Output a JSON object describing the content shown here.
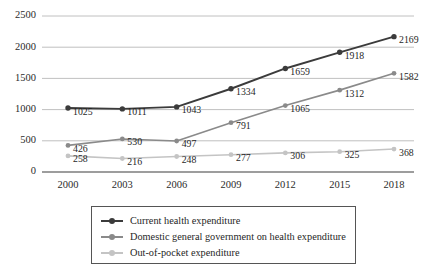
{
  "chart_data": {
    "type": "line",
    "title": "",
    "subtitle": "",
    "xlabel": "",
    "ylabel": "",
    "categories": [
      "2000",
      "2003",
      "2006",
      "2009",
      "2012",
      "2015",
      "2018"
    ],
    "x": [
      2000,
      2003,
      2006,
      2009,
      2012,
      2015,
      2018
    ],
    "ylim": [
      0,
      2500
    ],
    "yticks": [
      0,
      500,
      1000,
      1500,
      2000,
      2500
    ],
    "ytick_labels": [
      "0",
      "500",
      "1000",
      "1500",
      "2000",
      "2500"
    ],
    "grid": true,
    "grid_axis": "y",
    "legend_position": "bottom",
    "data_labels": true,
    "series": [
      {
        "name": "Current health expenditure",
        "color": "#3b3b3b",
        "values": [
          1025,
          1011,
          1043,
          1334,
          1659,
          1918,
          2169
        ],
        "labels": [
          "1025",
          "1011",
          "1043",
          "1334",
          "1659",
          "1918",
          "2169"
        ]
      },
      {
        "name": "Domestic general government on health expenditure",
        "color": "#8a8a8a",
        "values": [
          426,
          530,
          497,
          791,
          1065,
          1312,
          1582
        ],
        "labels": [
          "426",
          "530",
          "497",
          "791",
          "1065",
          "1312",
          "1582"
        ]
      },
      {
        "name": "Out-of-pocket expenditure",
        "color": "#c4c4c4",
        "values": [
          258,
          216,
          248,
          277,
          306,
          325,
          368
        ],
        "labels": [
          "258",
          "216",
          "248",
          "277",
          "306",
          "325",
          "368"
        ]
      }
    ]
  },
  "legend": {
    "items": [
      {
        "label": "Current health expenditure",
        "color": "#3b3b3b"
      },
      {
        "label": "Domestic general government on health expenditure",
        "color": "#8a8a8a"
      },
      {
        "label": "Out-of-pocket expenditure",
        "color": "#c4c4c4"
      }
    ]
  },
  "colors": {
    "gridline": "#b9b9b9",
    "axis": "#7d7d7d",
    "text": "#1f1f1f",
    "background": "#ffffff"
  }
}
